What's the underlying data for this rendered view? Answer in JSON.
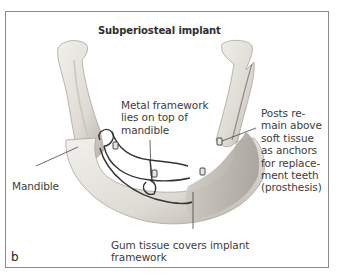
{
  "figure": {
    "title": "Subperiosteal implant",
    "panel_letter": "b",
    "labels": {
      "framework": "Metal framework\nlies on top of\nmandible",
      "posts": "Posts re-\nmain above\nsoft tissue\nas anchors\nfor replace-\nment teeth\n(prosthesis)",
      "mandible": "Mandible",
      "gum": "Gum tissue covers implant\nframework"
    },
    "colors": {
      "bone": "#e4e2dc",
      "bone_shadow": "#b9b6ae",
      "framework": "#3a3a3a",
      "gum": "#cfcbc3",
      "leader": "#444444",
      "border": "#8a8a8a"
    }
  }
}
